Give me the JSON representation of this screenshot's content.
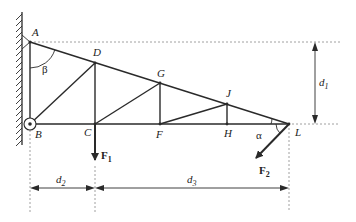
{
  "diagram": {
    "type": "truss",
    "colors": {
      "line": "#2a2a2a",
      "dashed": "#888888",
      "background": "#ffffff"
    },
    "nodes": [
      {
        "id": "A",
        "label": "A",
        "x": 30,
        "y": 42
      },
      {
        "id": "B",
        "label": "B",
        "x": 30,
        "y": 124
      },
      {
        "id": "C",
        "label": "C",
        "x": 95,
        "y": 124
      },
      {
        "id": "D",
        "label": "D",
        "x": 95,
        "y": 63
      },
      {
        "id": "F",
        "label": "F",
        "x": 160,
        "y": 124
      },
      {
        "id": "G",
        "label": "G",
        "x": 160,
        "y": 83
      },
      {
        "id": "H",
        "label": "H",
        "x": 227,
        "y": 124
      },
      {
        "id": "J",
        "label": "J",
        "x": 227,
        "y": 104
      },
      {
        "id": "L",
        "label": "L",
        "x": 289,
        "y": 124
      }
    ],
    "members": [
      [
        "A",
        "D"
      ],
      [
        "D",
        "G"
      ],
      [
        "G",
        "J"
      ],
      [
        "J",
        "L"
      ],
      [
        "B",
        "C"
      ],
      [
        "C",
        "F"
      ],
      [
        "F",
        "H"
      ],
      [
        "H",
        "L"
      ],
      [
        "A",
        "B"
      ],
      [
        "B",
        "D"
      ],
      [
        "D",
        "C"
      ],
      [
        "C",
        "G"
      ],
      [
        "G",
        "F"
      ],
      [
        "F",
        "J"
      ],
      [
        "J",
        "H"
      ]
    ],
    "forces": [
      {
        "name": "F",
        "subscript": "1",
        "at": "C",
        "direction": "down"
      },
      {
        "name": "F",
        "subscript": "2",
        "at": "L",
        "direction": "down-left"
      }
    ],
    "angles": [
      {
        "symbol": "β",
        "at": "A"
      },
      {
        "symbol": "α",
        "at": "L"
      }
    ],
    "dimensions": [
      {
        "name": "d",
        "subscript": "1",
        "orientation": "vertical",
        "between": [
          "A-level",
          "B-level"
        ]
      },
      {
        "name": "d",
        "subscript": "2",
        "orientation": "horizontal",
        "between": [
          "B",
          "C"
        ]
      },
      {
        "name": "d",
        "subscript": "3",
        "orientation": "horizontal",
        "between": [
          "C",
          "L"
        ]
      }
    ],
    "supports": [
      {
        "at": "A",
        "type": "wall-support"
      },
      {
        "at": "B",
        "type": "pin"
      }
    ]
  },
  "labels": {
    "A": "A",
    "B": "B",
    "C": "C",
    "D": "D",
    "F": "F",
    "G": "G",
    "H": "H",
    "J": "J",
    "L": "L",
    "beta": "β",
    "alpha": "α",
    "F1_main": "F",
    "F1_sub": "1",
    "F2_main": "F",
    "F2_sub": "2",
    "d1_main": "d",
    "d1_sub": "1",
    "d2_main": "d",
    "d2_sub": "2",
    "d3_main": "d",
    "d3_sub": "3"
  }
}
